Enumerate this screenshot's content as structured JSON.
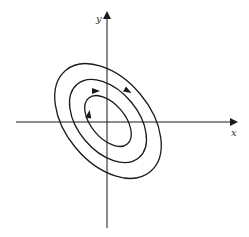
{
  "diagram": {
    "type": "phase-portrait",
    "axes": {
      "x_label": "x",
      "y_label": "y",
      "origin": [
        107,
        122
      ],
      "x_range_px": [
        16,
        235
      ],
      "y_range_px": [
        14,
        228
      ]
    },
    "orbits": [
      {
        "name": "inner",
        "rx": 17,
        "ry": 30,
        "rotation_deg": -40,
        "arrow": {
          "x": 89,
          "y": 114,
          "angle_deg": -80
        }
      },
      {
        "name": "middle",
        "rx": 30,
        "ry": 48,
        "rotation_deg": -40,
        "arrow": {
          "x": 96,
          "y": 91,
          "angle_deg": 0
        }
      },
      {
        "name": "outer",
        "rx": 42,
        "ry": 66,
        "rotation_deg": -40,
        "arrow": {
          "x": 128,
          "y": 91,
          "angle_deg": 30
        }
      }
    ],
    "colors": {
      "stroke": "#1a1a1a",
      "background": "#ffffff"
    }
  }
}
